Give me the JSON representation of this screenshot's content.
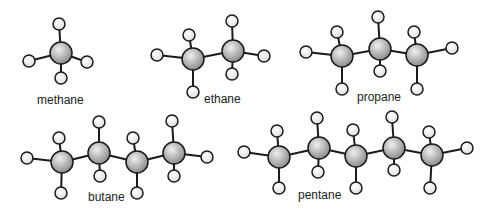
{
  "colors": {
    "background": "#ffffff",
    "bond": "#1a1a1a",
    "carbon_light": "#f0f0f0",
    "carbon_dark": "#8c8c8c",
    "hydrogen_fill": "#f4f4f4",
    "outline": "#1a1a1a"
  },
  "molecules": [
    {
      "name": "methane",
      "label": "methane",
      "label_pos": [
        37,
        93
      ],
      "carbons": [
        [
          61,
          53
        ]
      ],
      "hydrogens": [
        [
          [
            59,
            24
          ],
          0
        ],
        [
          [
            29,
            61
          ],
          0
        ],
        [
          [
            87,
            62
          ],
          0
        ],
        [
          [
            61,
            78
          ],
          0
        ]
      ]
    },
    {
      "name": "ethane",
      "label": "ethane",
      "label_pos": [
        204,
        92
      ],
      "carbons": [
        [
          193,
          59
        ],
        [
          233,
          51
        ]
      ],
      "hydrogens": [
        [
          [
            189,
            35
          ],
          0
        ],
        [
          [
            157,
            55
          ],
          0
        ],
        [
          [
            193,
            92
          ],
          0
        ],
        [
          [
            232,
            21
          ],
          1
        ],
        [
          [
            264,
            56
          ],
          1
        ],
        [
          [
            232,
            74
          ],
          1
        ]
      ]
    },
    {
      "name": "propane",
      "label": "propane",
      "label_pos": [
        357,
        90
      ],
      "carbons": [
        [
          342,
          56
        ],
        [
          380,
          49
        ],
        [
          417,
          55
        ]
      ],
      "hydrogens": [
        [
          [
            306,
            52
          ],
          0
        ],
        [
          [
            337,
            32
          ],
          0
        ],
        [
          [
            342,
            89
          ],
          0
        ],
        [
          [
            378,
            17
          ],
          1
        ],
        [
          [
            380,
            71
          ],
          1
        ],
        [
          [
            414,
            32
          ],
          2
        ],
        [
          [
            417,
            89
          ],
          2
        ],
        [
          [
            452,
            48
          ],
          2
        ]
      ]
    },
    {
      "name": "butane",
      "label": "butane",
      "label_pos": [
        88,
        190
      ],
      "carbons": [
        [
          62,
          162
        ],
        [
          99,
          153
        ],
        [
          137,
          162
        ],
        [
          174,
          153
        ]
      ],
      "hydrogens": [
        [
          [
            27,
            158
          ],
          0
        ],
        [
          [
            59,
            138
          ],
          0
        ],
        [
          [
            61,
            193
          ],
          0
        ],
        [
          [
            99,
            122
          ],
          1
        ],
        [
          [
            100,
            176
          ],
          1
        ],
        [
          [
            133,
            138
          ],
          2
        ],
        [
          [
            137,
            193
          ],
          2
        ],
        [
          [
            172,
            121
          ],
          3
        ],
        [
          [
            174,
            176
          ],
          3
        ],
        [
          [
            207,
            157
          ],
          3
        ]
      ]
    },
    {
      "name": "pentane",
      "label": "pentane",
      "label_pos": [
        298,
        188
      ],
      "carbons": [
        [
          279,
          157
        ],
        [
          319,
          148
        ],
        [
          356,
          156
        ],
        [
          394,
          148
        ],
        [
          432,
          155
        ]
      ],
      "hydrogens": [
        [
          [
            244,
            152
          ],
          0
        ],
        [
          [
            277,
            131
          ],
          0
        ],
        [
          [
            279,
            188
          ],
          0
        ],
        [
          [
            317,
            118
          ],
          1
        ],
        [
          [
            318,
            172
          ],
          1
        ],
        [
          [
            353,
            130
          ],
          2
        ],
        [
          [
            356,
            188
          ],
          2
        ],
        [
          [
            392,
            117
          ],
          3
        ],
        [
          [
            394,
            170
          ],
          3
        ],
        [
          [
            429,
            132
          ],
          4
        ],
        [
          [
            430,
            188
          ],
          4
        ],
        [
          [
            467,
            148
          ],
          4
        ]
      ]
    }
  ],
  "atom_radius": {
    "carbon": 11,
    "hydrogen": 6
  }
}
